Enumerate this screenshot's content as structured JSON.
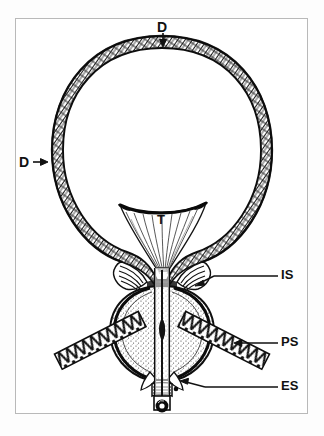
{
  "figure": {
    "style": "black-and-white line drawing with hatched muscle texture",
    "border_color": "#b9b9b9",
    "ink_color": "#111111",
    "background_color": "#ffffff"
  },
  "labels": {
    "detrusor_top": {
      "text": "D",
      "meaning": "detrusor muscle (bladder wall) — dome",
      "arrow": "down"
    },
    "detrusor_left": {
      "text": "D",
      "meaning": "detrusor muscle (bladder wall) — lateral",
      "arrow": "right"
    },
    "trigone": {
      "text": "T",
      "meaning": "trigone",
      "arrow": "none"
    },
    "internal_sphincter": {
      "text": "IS",
      "meaning": "internal sphincter / bladder neck",
      "arrow": "leader-line-left"
    },
    "periurethral_striated": {
      "text": "PS",
      "meaning": "periurethral striated muscle",
      "arrow": "leader-line-left"
    },
    "external_sphincter": {
      "text": "ES",
      "meaning": "external sphincter",
      "arrow": "leader-line-left"
    }
  },
  "structures": [
    {
      "name": "bladder-dome",
      "label_ref": "detrusor_top"
    },
    {
      "name": "bladder-wall",
      "label_ref": "detrusor_left"
    },
    {
      "name": "trigone",
      "label_ref": "trigone"
    },
    {
      "name": "bladder-neck",
      "label_ref": "internal_sphincter"
    },
    {
      "name": "prostate",
      "label_ref": null
    },
    {
      "name": "urethra",
      "label_ref": null
    },
    {
      "name": "pelvic-floor-muscle",
      "label_ref": "periurethral_striated"
    },
    {
      "name": "external-sphincter",
      "label_ref": "external_sphincter"
    }
  ]
}
